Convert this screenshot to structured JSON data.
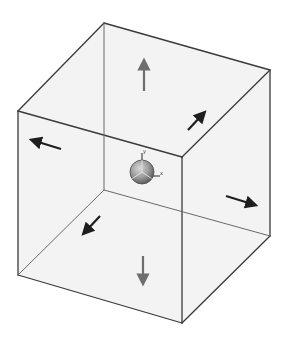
{
  "diagram": {
    "colors": {
      "background": "#ffffff",
      "face_fill": "#ececec",
      "edge": "#3a3a3a",
      "hidden_edge": "#6a6a6a",
      "arrow_dark": "#1e1e1e",
      "arrow_gray": "#6e6e6e",
      "gizmo_fill": "#9a9a9a",
      "gizmo_stroke": "#4a4a4a"
    },
    "cube": {
      "vertices": {
        "back_top_left": [
          104,
          23
        ],
        "back_top_right": [
          270,
          70
        ],
        "back_bottom_left": [
          104,
          190
        ],
        "back_bottom_right": [
          270,
          236
        ],
        "front_top_left": [
          18,
          111
        ],
        "front_top_right": [
          182,
          157
        ],
        "front_bottom_left": [
          18,
          275
        ],
        "front_bottom_right": [
          182,
          323
        ]
      }
    },
    "gizmo": {
      "center": [
        142,
        172
      ],
      "radius": 12,
      "axis_labels": {
        "y": "y",
        "x": "x"
      }
    },
    "arrows": [
      {
        "name": "arrow-up",
        "from": [
          144,
          91
        ],
        "to": [
          144,
          64
        ],
        "tone": "gray"
      },
      {
        "name": "arrow-down",
        "from": [
          143,
          256
        ],
        "to": [
          143,
          280
        ],
        "tone": "gray"
      },
      {
        "name": "arrow-left",
        "from": [
          61,
          149
        ],
        "to": [
          35,
          141
        ],
        "tone": "dark"
      },
      {
        "name": "arrow-right",
        "from": [
          226,
          196
        ],
        "to": [
          252,
          204
        ],
        "tone": "dark"
      },
      {
        "name": "arrow-back",
        "from": [
          188,
          130
        ],
        "to": [
          202,
          115
        ],
        "tone": "dark"
      },
      {
        "name": "arrow-front",
        "from": [
          100,
          216
        ],
        "to": [
          86,
          231
        ],
        "tone": "dark"
      }
    ]
  }
}
